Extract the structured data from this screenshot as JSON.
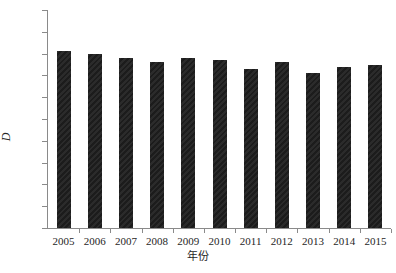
{
  "chart_data": {
    "type": "bar",
    "title": "",
    "subtitle": "",
    "xlabel": "年份",
    "ylabel": "D",
    "categories": [
      "2005",
      "2006",
      "2007",
      "2008",
      "2009",
      "2010",
      "2011",
      "2012",
      "2013",
      "2014",
      "2015"
    ],
    "values": [
      0.81,
      0.8,
      0.78,
      0.76,
      0.78,
      0.77,
      0.73,
      0.76,
      0.71,
      0.74,
      0.75
    ],
    "series": [
      {
        "name": "D",
        "values": [
          0.81,
          0.8,
          0.78,
          0.76,
          0.78,
          0.77,
          0.73,
          0.76,
          0.71,
          0.74,
          0.75
        ]
      }
    ],
    "ylim": [
      0,
      1
    ],
    "ytick_labels": [
      "0",
      "0.1",
      "0.2",
      "0.3",
      "0.4",
      "0.5",
      "0.6",
      "0.7",
      "0.8",
      "0.9",
      "1"
    ],
    "ytick_values": [
      0,
      0.1,
      0.2,
      0.3,
      0.4,
      0.5,
      0.6,
      0.7,
      0.8,
      0.9,
      1
    ],
    "grid": false,
    "legend": null,
    "legend_position": "none",
    "bar_color": "#262626",
    "axis_color": "#8a8a8a",
    "text_color": "#262626",
    "background_color": "#ffffff"
  }
}
